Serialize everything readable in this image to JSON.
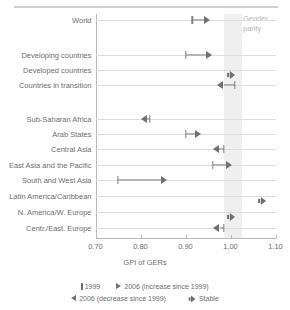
{
  "chart_data": {
    "type": "scatter",
    "title": "",
    "xlabel": "GPI of GERs",
    "ylabel": "",
    "xlim": [
      0.7,
      1.1
    ],
    "xticks": [
      "0.70",
      "0.80",
      "0.90",
      "1.00",
      "1.10"
    ],
    "xtick_values": [
      0.7,
      0.8,
      0.9,
      1.0,
      1.1
    ],
    "grid": false,
    "legend_position": "bottom",
    "annotations": [
      {
        "text_line1": "Gender",
        "text_line2": "parity",
        "band_start": 0.985,
        "band_end": 1.025
      }
    ],
    "categories": [
      "World",
      "Developing countries",
      "Developed countries",
      "Countries in transition",
      "Sub-Saharan Africa",
      "Arab States",
      "Central Asia",
      "East Asia and the Pacific",
      "South and West Asia",
      "Latin America/Caribbean",
      "N. America/W. Europe",
      "Centr./East. Europe"
    ],
    "series": [
      {
        "name": "1999",
        "values": [
          0.915,
          0.9,
          1.0,
          1.01,
          0.82,
          0.9,
          0.985,
          0.96,
          0.75,
          1.07,
          1.0,
          0.985
        ]
      },
      {
        "name": "2006",
        "values": [
          0.955,
          0.96,
          1.0,
          0.97,
          0.8,
          0.935,
          0.96,
          1.005,
          0.86,
          1.07,
          1.0,
          0.962
        ]
      }
    ],
    "directions": [
      "increase",
      "increase",
      "stable",
      "decrease",
      "decrease",
      "increase",
      "decrease",
      "increase",
      "increase",
      "stable",
      "stable",
      "decrease"
    ],
    "group_breaks_after": [
      0,
      3
    ]
  },
  "legend": {
    "items": [
      {
        "marker": "bar-1999-icon",
        "label": "1999"
      },
      {
        "marker": "arrow-right-icon",
        "label": "2006 (increase since 1999)"
      },
      {
        "marker": "arrow-left-icon",
        "label": "2006 (decrease since 1999)"
      },
      {
        "marker": "stable-icon",
        "label": "Stable"
      }
    ]
  },
  "colors": {
    "marker": "#707070",
    "band": "#efefef",
    "axis": "#b9b9b9",
    "rule": "#dcdcdc",
    "text": "#6d6d6d",
    "annotation_text": "#b5b5b5"
  }
}
